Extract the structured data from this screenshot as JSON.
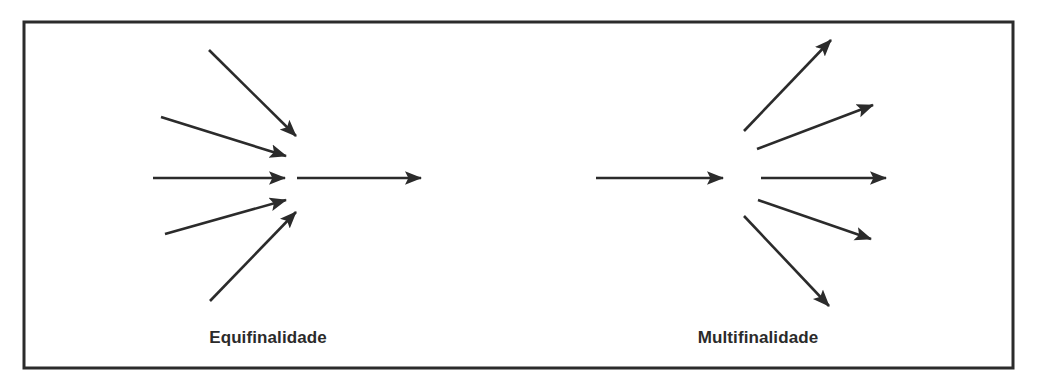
{
  "figure": {
    "background_color": "#ffffff",
    "stroke_color": "#2b2b2b",
    "border": {
      "x": 24,
      "y": 22,
      "width": 989,
      "height": 346,
      "stroke_width": 3
    }
  },
  "panels": [
    {
      "id": "equifinalidade",
      "caption": "Equifinalidade",
      "caption_x": 268,
      "caption_y": 344,
      "node_x": 290,
      "node_y": 178,
      "description": "many converging inputs lead to one outcome",
      "incoming_arrows": [
        {
          "x1": 209,
          "y1": 50,
          "x2": 296,
          "y2": 136
        },
        {
          "x1": 161,
          "y1": 117,
          "x2": 286,
          "y2": 156
        },
        {
          "x1": 153,
          "y1": 178,
          "x2": 285,
          "y2": 178
        },
        {
          "x1": 165,
          "y1": 234,
          "x2": 286,
          "y2": 200
        },
        {
          "x1": 210,
          "y1": 301,
          "x2": 296,
          "y2": 212
        }
      ],
      "outgoing_arrows": [
        {
          "x1": 297,
          "y1": 178,
          "x2": 421,
          "y2": 178
        }
      ]
    },
    {
      "id": "multifinalidade",
      "caption": "Multifinalidade",
      "caption_x": 758,
      "caption_y": 344,
      "node_x": 740,
      "node_y": 178,
      "description": "one input leads to many diverging outcomes",
      "incoming_arrows": [
        {
          "x1": 596,
          "y1": 178,
          "x2": 723,
          "y2": 178
        }
      ],
      "outgoing_arrows": [
        {
          "x1": 744,
          "y1": 131,
          "x2": 831,
          "y2": 40
        },
        {
          "x1": 757,
          "y1": 149,
          "x2": 873,
          "y2": 105
        },
        {
          "x1": 761,
          "y1": 178,
          "x2": 886,
          "y2": 178
        },
        {
          "x1": 758,
          "y1": 200,
          "x2": 871,
          "y2": 239
        },
        {
          "x1": 744,
          "y1": 216,
          "x2": 829,
          "y2": 306
        }
      ]
    }
  ],
  "chart_data": {
    "type": "diagram",
    "title": "",
    "subtitle": "",
    "concepts": [
      "Equifinalidade",
      "Multifinalidade"
    ],
    "legend": [],
    "annotations": [
      "Equifinalidade",
      "Multifinalidade"
    ],
    "equifinalidade_arrow_count_in": 5,
    "equifinalidade_arrow_count_out": 1,
    "multifinalidade_arrow_count_in": 1,
    "multifinalidade_arrow_count_out": 5
  }
}
